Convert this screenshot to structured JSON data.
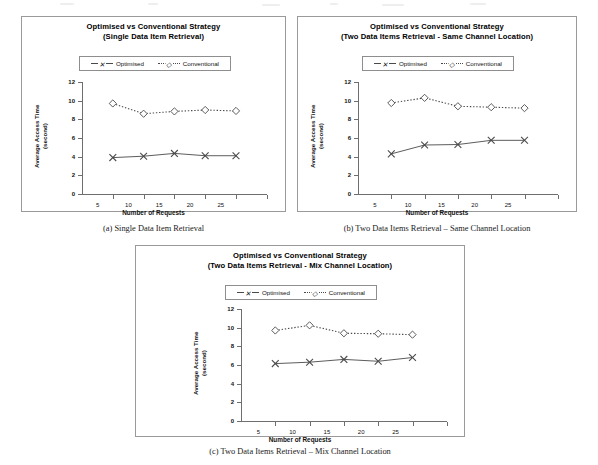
{
  "figure": {
    "axis_titles": {
      "y": "Average Access Time",
      "y2": "(second)",
      "x": "Number of Requests"
    },
    "y_ticks": [
      "0",
      "2",
      "4",
      "6",
      "8",
      "10",
      "12"
    ],
    "x_ticks": [
      "5",
      "10",
      "15",
      "20",
      "25"
    ],
    "legend": {
      "optimised": "Optimised",
      "conventional": "Conventional",
      "optimised_marker": "cross-marker-icon",
      "conventional_marker": "diamond-marker-icon"
    },
    "captions": {
      "a": "(a) Single Data Item Retrieval",
      "b": "(b) Two Data Items Retrieval – Same Channel Location",
      "c": "(c) Two Data Items Retrieval – Mix Channel Location"
    },
    "colors": {
      "line": "#4a4a4a",
      "axis": "#6e6e6e",
      "frame": "#9a9a9a",
      "text": "#000000"
    }
  },
  "chart_data": [
    {
      "id": "chart-a",
      "type": "line",
      "title": "Optimised  vs Conventional Strategy",
      "subtitle": "(Single Data Item Retrieval)",
      "xlabel": "Number of Requests",
      "ylabel": "Average Access Time (second)",
      "categories": [
        5,
        10,
        15,
        20,
        25
      ],
      "xlim": [
        0,
        30
      ],
      "ylim": [
        0,
        12
      ],
      "grid": false,
      "legend_position": "top-center",
      "series": [
        {
          "name": "Optimised",
          "marker": "x",
          "linestyle": "solid",
          "values": [
            3.9,
            4.05,
            4.35,
            4.1,
            4.1
          ]
        },
        {
          "name": "Conventional",
          "marker": "diamond",
          "linestyle": "dotted",
          "values": [
            9.7,
            8.6,
            8.85,
            9.0,
            8.9
          ]
        }
      ]
    },
    {
      "id": "chart-b",
      "type": "line",
      "title": "Optimised  vs Conventional Strategy",
      "subtitle": "(Two Data Items Retrieval - Same Channel Location)",
      "xlabel": "Number of Requests",
      "ylabel": "Average Access Time (second)",
      "categories": [
        5,
        10,
        15,
        20,
        25
      ],
      "xlim": [
        0,
        30
      ],
      "ylim": [
        0,
        12
      ],
      "grid": false,
      "legend_position": "top-center",
      "series": [
        {
          "name": "Optimised",
          "marker": "x",
          "linestyle": "solid",
          "values": [
            4.3,
            5.25,
            5.3,
            5.75,
            5.75
          ]
        },
        {
          "name": "Conventional",
          "marker": "diamond",
          "linestyle": "dotted",
          "values": [
            9.75,
            10.3,
            9.4,
            9.3,
            9.2
          ]
        }
      ]
    },
    {
      "id": "chart-c",
      "type": "line",
      "title": "Optimised  vs Conventional Strategy",
      "subtitle": "(Two Data Items Retrieval - Mix Channel Location)",
      "xlabel": "Number of Requests",
      "ylabel": "Average Access Time (second)",
      "categories": [
        5,
        10,
        15,
        20,
        25
      ],
      "xlim": [
        0,
        30
      ],
      "ylim": [
        0,
        12
      ],
      "grid": false,
      "legend_position": "top-center",
      "series": [
        {
          "name": "Optimised",
          "marker": "x",
          "linestyle": "solid",
          "values": [
            6.15,
            6.3,
            6.6,
            6.4,
            6.8
          ]
        },
        {
          "name": "Conventional",
          "marker": "diamond",
          "linestyle": "dotted",
          "values": [
            9.7,
            10.25,
            9.4,
            9.35,
            9.25
          ]
        }
      ]
    }
  ]
}
